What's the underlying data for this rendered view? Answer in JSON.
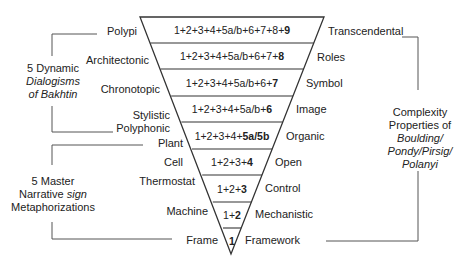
{
  "diagram": {
    "type": "inverted-triangle-hierarchy",
    "levels": [
      {
        "level": 9,
        "formula_prefix": "1+2+3+4+5a/b+6+7+8+",
        "formula_bold": "9",
        "left_label": "Polypi",
        "right_label": "Transcendental"
      },
      {
        "level": 8,
        "formula_prefix": "1+2+3+4+5a/b+6+7+",
        "formula_bold": "8",
        "left_label": "Architectonic",
        "right_label": "Roles"
      },
      {
        "level": 7,
        "formula_prefix": "1+2+3+4+5a/b+6+",
        "formula_bold": "7",
        "left_label": "Chronotopic",
        "right_label": "Symbol"
      },
      {
        "level": 6,
        "formula_prefix": "1+2+3+4+5a/b+",
        "formula_bold": "6",
        "left_label": "Stylistic",
        "right_label": "Image"
      },
      {
        "level": 5,
        "formula_prefix": "1+2+3+4+",
        "formula_bold": "5a/5b",
        "left_label": "Polyphonic",
        "left_label_2": "Plant",
        "right_label": "Organic"
      },
      {
        "level": 4,
        "formula_prefix": "1+2+3+",
        "formula_bold": "4",
        "left_label": "Cell",
        "right_label": "Open"
      },
      {
        "level": 3,
        "formula_prefix": "1+2+",
        "formula_bold": "3",
        "left_label": "Thermostat",
        "right_label": "Control"
      },
      {
        "level": 2,
        "formula_prefix": "1+",
        "formula_bold": "2",
        "left_label": "Machine",
        "right_label": "Mechanistic"
      },
      {
        "level": 1,
        "formula_prefix": "",
        "formula_bold": "1",
        "left_label": "Frame",
        "right_label": "Framework"
      }
    ],
    "left_groups": [
      {
        "line1": "5 Dynamic",
        "line2": "Dialogisms",
        "line3": "of Bakhtin",
        "italic_lines": [
          2,
          3
        ]
      },
      {
        "line1": "5 Master",
        "line2_normal": "Narrative ",
        "line2_italic": "sign",
        "line3": "Metaphorizations"
      }
    ],
    "right_group": {
      "line1": "Complexity",
      "line2": "Properties of",
      "line3": "Boulding/",
      "line4": "Pondy/Pirsig/",
      "line5": "Polanyi"
    },
    "colors": {
      "line": "#333333",
      "text": "#222222",
      "background": "#ffffff"
    }
  }
}
